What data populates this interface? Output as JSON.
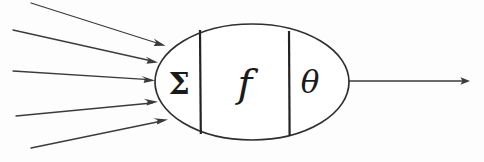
{
  "diagram": {
    "type": "neuron-model-diagram",
    "background_color": "#fdfdfd",
    "stroke_color": "#3b3b3b",
    "body_stroke_color": "#2f2f2f",
    "divider_color": "#232323",
    "symbol_color": "#1a1a1a",
    "cell_body": {
      "shape": "ellipse",
      "cx": 252,
      "cy": 82,
      "rx": 97,
      "ry": 58
    },
    "compartments": [
      {
        "name": "summation",
        "symbol": "Σ",
        "x": 179,
        "y": 94,
        "class": "sym-sigma"
      },
      {
        "name": "activation-function",
        "symbol": "f",
        "x": 245,
        "y": 97,
        "class": "sym-f"
      },
      {
        "name": "threshold",
        "symbol": "θ",
        "x": 310,
        "y": 93,
        "class": "sym-theta"
      }
    ],
    "dividers": [
      {
        "name": "divider-sigma-f",
        "x": 200,
        "y1": 30,
        "y2": 134
      },
      {
        "name": "divider-f-theta",
        "x": 289,
        "y1": 31,
        "y2": 136
      }
    ],
    "input_arrows": [
      {
        "name": "input-arrow-1",
        "x1": 31,
        "y1": 3,
        "x2": 164,
        "y2": 45
      },
      {
        "name": "input-arrow-2",
        "x1": 13,
        "y1": 30,
        "x2": 157,
        "y2": 62
      },
      {
        "name": "input-arrow-3",
        "x1": 13,
        "y1": 71,
        "x2": 154,
        "y2": 80
      },
      {
        "name": "input-arrow-4",
        "x1": 16,
        "y1": 116,
        "x2": 157,
        "y2": 102
      },
      {
        "name": "input-arrow-5",
        "x1": 31,
        "y1": 148,
        "x2": 167,
        "y2": 119
      }
    ],
    "output_arrow": {
      "name": "output-arrow",
      "x1": 349,
      "y1": 81,
      "x2": 470,
      "y2": 81
    },
    "counts": {
      "inputs": 5,
      "outputs": 1,
      "compartments": 3
    }
  }
}
